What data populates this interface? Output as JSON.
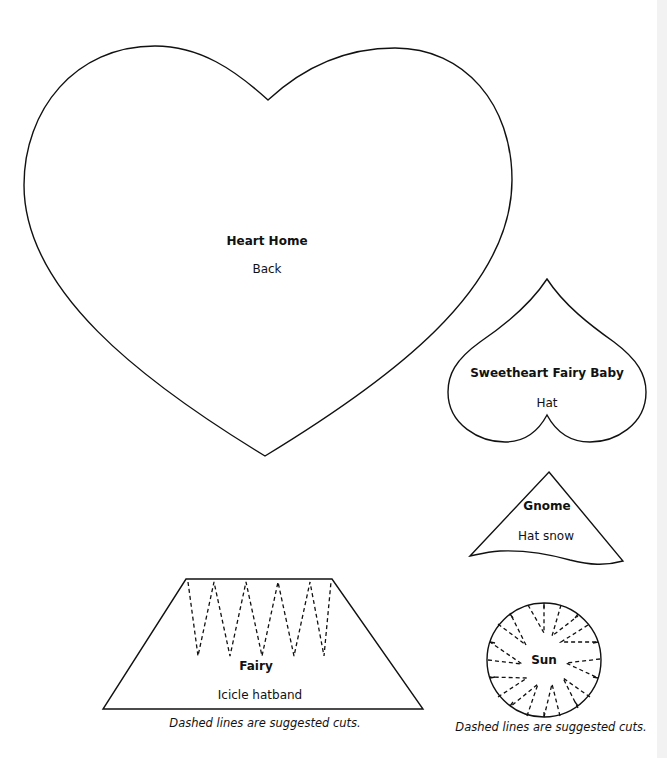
{
  "page": {
    "background": "#ffffff",
    "line_color": "#111111"
  },
  "templates": [
    {
      "id": "heart-home",
      "title": "Heart Home",
      "subtitle": "Back",
      "shape": "heart"
    },
    {
      "id": "sweetheart-fairy-baby",
      "title": "Sweetheart Fairy Baby",
      "subtitle": "Hat",
      "shape": "inverted-heart"
    },
    {
      "id": "gnome",
      "title": "Gnome",
      "subtitle": "Hat snow",
      "shape": "wavy-triangle"
    },
    {
      "id": "fairy",
      "title": "Fairy",
      "subtitle": "Icicle hatband",
      "shape": "trapezoid-with-dashed-zigzag",
      "caption": "Dashed lines are suggested cuts."
    },
    {
      "id": "sun",
      "title": "Sun",
      "subtitle": "",
      "shape": "circle-with-dashed-rays",
      "caption": "Dashed lines are suggested cuts."
    }
  ]
}
